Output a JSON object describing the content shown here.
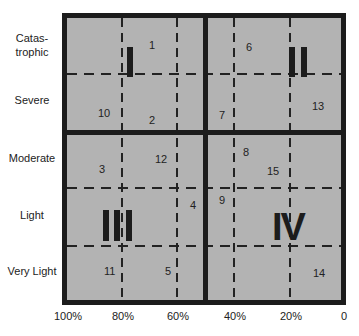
{
  "diagram": {
    "row_labels": [
      "Catas-\ntrophic",
      "Severe",
      "Moderate",
      "Light",
      "Very Light"
    ],
    "x_axis_labels": [
      "100%",
      "80%",
      "60%",
      "40%",
      "20%",
      "0"
    ],
    "quadrants": [
      "I",
      "II",
      "III",
      "IV"
    ],
    "points": [
      {
        "id": "1",
        "quadrant": "I",
        "row": "Catastrophic"
      },
      {
        "id": "2",
        "quadrant": "I",
        "row": "Severe"
      },
      {
        "id": "10",
        "quadrant": "I",
        "row": "Severe"
      },
      {
        "id": "6",
        "quadrant": "II",
        "row": "Catastrophic"
      },
      {
        "id": "7",
        "quadrant": "II",
        "row": "Severe"
      },
      {
        "id": "13",
        "quadrant": "II",
        "row": "Severe"
      },
      {
        "id": "3",
        "quadrant": "III",
        "row": "Moderate"
      },
      {
        "id": "12",
        "quadrant": "III",
        "row": "Moderate"
      },
      {
        "id": "4",
        "quadrant": "III",
        "row": "Light"
      },
      {
        "id": "11",
        "quadrant": "III",
        "row": "Very Light"
      },
      {
        "id": "5",
        "quadrant": "III",
        "row": "Very Light"
      },
      {
        "id": "8",
        "quadrant": "IV",
        "row": "Moderate"
      },
      {
        "id": "15",
        "quadrant": "IV",
        "row": "Moderate"
      },
      {
        "id": "9",
        "quadrant": "IV",
        "row": "Light"
      },
      {
        "id": "14",
        "quadrant": "IV",
        "row": "Very Light"
      }
    ],
    "colors": {
      "fill": "#b3b3b3",
      "line": "#1c1c1c"
    }
  }
}
